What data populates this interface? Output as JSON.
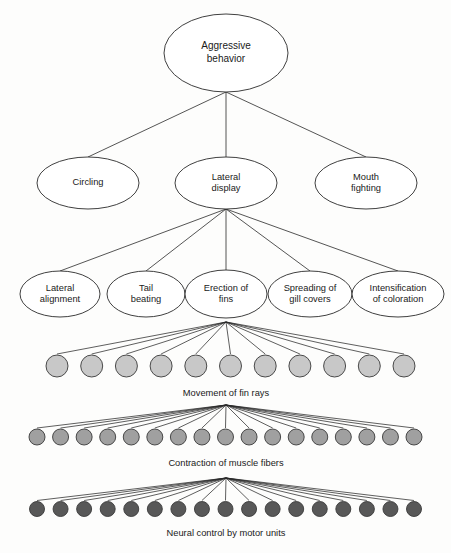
{
  "diagram": {
    "type": "hierarchical-tree",
    "background_color": "#fdfdfc",
    "stroke_color": "#2a2a2a",
    "levels": [
      {
        "level": 0,
        "nodes": [
          {
            "id": "aggressive-behavior",
            "label_line1": "Aggressive",
            "label_line2": "behavior",
            "cx": 226,
            "cy": 53,
            "rx": 62,
            "ry": 39
          }
        ]
      },
      {
        "level": 1,
        "nodes": [
          {
            "id": "circling",
            "label_line1": "Circling",
            "label_line2": "",
            "cx": 88,
            "cy": 183,
            "rx": 51,
            "ry": 26
          },
          {
            "id": "lateral-display",
            "label_line1": "Lateral",
            "label_line2": "display",
            "cx": 226,
            "cy": 183,
            "rx": 51,
            "ry": 26
          },
          {
            "id": "mouth-fighting",
            "label_line1": "Mouth",
            "label_line2": "fighting",
            "cx": 366,
            "cy": 183,
            "rx": 51,
            "ry": 26
          }
        ]
      },
      {
        "level": 2,
        "nodes": [
          {
            "id": "lateral-alignment",
            "label_line1": "Lateral",
            "label_line2": "alignment",
            "cx": 60,
            "cy": 294,
            "rx": 40,
            "ry": 23
          },
          {
            "id": "tail-beating",
            "label_line1": "Tail",
            "label_line2": "beating",
            "cx": 146,
            "cy": 294,
            "rx": 39,
            "ry": 23
          },
          {
            "id": "erection-of-fins",
            "label_line1": "Erection of",
            "label_line2": "fins",
            "cx": 226,
            "cy": 294,
            "rx": 41,
            "ry": 24
          },
          {
            "id": "spreading-of-gill-covers",
            "label_line1": "Spreading of",
            "label_line2": "gill covers",
            "cx": 310,
            "cy": 294,
            "rx": 42,
            "ry": 23
          },
          {
            "id": "intensification-of-coloration",
            "label_line1": "Intensification",
            "label_line2": "of coloration",
            "cx": 398,
            "cy": 294,
            "rx": 46,
            "ry": 23
          }
        ]
      }
    ],
    "unit_rows": [
      {
        "id": "fin-rays-row",
        "label": "Movement of fin rays",
        "label_x": 226,
        "label_y": 394,
        "count": 11,
        "radius": 11,
        "cy": 366,
        "first_cx": 57,
        "last_cx": 404,
        "fill": "#c8c8c8",
        "fan_apex_x": 226,
        "fan_apex_y": 322
      },
      {
        "id": "muscle-fibers-row",
        "label": "Contraction of muscle fibers",
        "label_x": 226,
        "label_y": 464,
        "count": 17,
        "radius": 8,
        "cy": 437,
        "first_cx": 37,
        "last_cx": 414,
        "fill": "#a0a0a0",
        "fan_apex_x": 226,
        "fan_apex_y": 405
      },
      {
        "id": "motor-units-row",
        "label": "Neural control by motor units",
        "label_x": 226,
        "label_y": 534,
        "count": 17,
        "radius": 7.5,
        "cy": 509,
        "first_cx": 37,
        "last_cx": 414,
        "fill": "#585858",
        "fan_apex_x": 226,
        "fan_apex_y": 478
      }
    ],
    "edges": [
      {
        "from": "aggressive-behavior",
        "to": "circling"
      },
      {
        "from": "aggressive-behavior",
        "to": "lateral-display"
      },
      {
        "from": "aggressive-behavior",
        "to": "mouth-fighting"
      },
      {
        "from": "lateral-display",
        "to": "lateral-alignment"
      },
      {
        "from": "lateral-display",
        "to": "tail-beating"
      },
      {
        "from": "lateral-display",
        "to": "erection-of-fins"
      },
      {
        "from": "lateral-display",
        "to": "spreading-of-gill-covers"
      },
      {
        "from": "lateral-display",
        "to": "intensification-of-coloration"
      }
    ]
  }
}
